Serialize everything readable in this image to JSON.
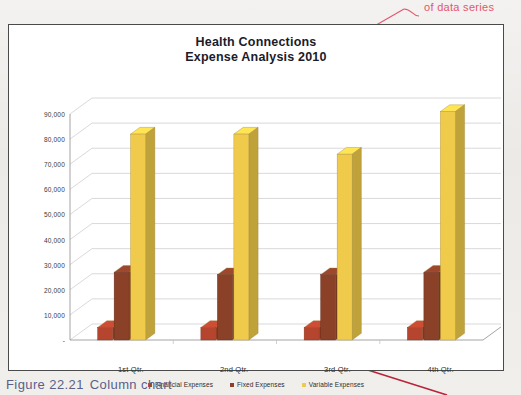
{
  "annotation": {
    "callout_label": "of data series",
    "callout_color": "#e4566b"
  },
  "figure": {
    "number": "Figure 22.21",
    "caption": "Column chart"
  },
  "chart_data": {
    "type": "bar",
    "title": "Health Connections",
    "subtitle": "Expense Analysis 2010",
    "xlabel": "",
    "ylabel": "",
    "categories": [
      "1st Qtr.",
      "2nd Qtr.",
      "3rd Qtr.",
      "4th Qtr."
    ],
    "series": [
      {
        "name": "Financial Expenses",
        "color": "#b5452e",
        "values": [
          5000,
          5000,
          5000,
          5000
        ]
      },
      {
        "name": "Fixed Expenses",
        "color": "#8b4028",
        "values": [
          27000,
          26000,
          26000,
          27000
        ]
      },
      {
        "name": "Variable Expenses",
        "color": "#f0ca4a",
        "values": [
          82000,
          82000,
          74000,
          91000
        ]
      }
    ],
    "ylim": [
      0,
      95000
    ],
    "yticks": [
      "-",
      "10,000",
      "20,000",
      "30,000",
      "40,000",
      "50,000",
      "60,000",
      "70,000",
      "80,000",
      "90,000"
    ],
    "ytick_values": [
      0,
      10000,
      20000,
      30000,
      40000,
      50000,
      60000,
      70000,
      80000,
      90000
    ],
    "grid": true,
    "legend_position": "bottom",
    "style": "3d-column"
  }
}
